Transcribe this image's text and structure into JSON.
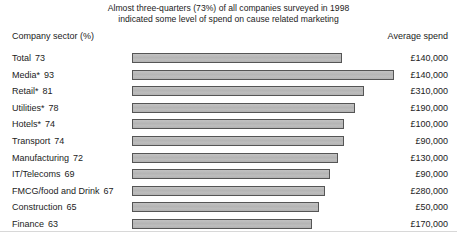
{
  "title": {
    "line1": "Almost three-quarters (73%) of all companies surveyed in 1998",
    "line2": "indicated some level of spend on cause related marketing"
  },
  "headers": {
    "left": "Company sector (%)",
    "right": "Average spend"
  },
  "chart_data": {
    "type": "bar",
    "orientation": "horizontal",
    "title": "Almost three-quarters (73%) of all companies surveyed in 1998 indicated some level of spend on cause related marketing",
    "xlabel": "",
    "ylabel": "Company sector (%)",
    "xlim": [
      0,
      100
    ],
    "grid": false,
    "legend": null,
    "categories": [
      "Total",
      "Media*",
      "Retail*",
      "Utilities*",
      "Hotels*",
      "Transport",
      "Manufacturing",
      "IT/Telecoms",
      "FMCG/food and Drink",
      "Construction",
      "Finance"
    ],
    "values": [
      73,
      93,
      81,
      78,
      74,
      74,
      72,
      69,
      67,
      65,
      63
    ],
    "value_unit": "%",
    "secondary_series": {
      "name": "Average spend",
      "values": [
        "£140,000",
        "£140,000",
        "£310,000",
        "£190,000",
        "£100,000",
        "£90,000",
        "£130,000",
        "£90,000",
        "£280,000",
        "£50,000",
        "£170,000"
      ],
      "numeric_values": [
        140000,
        140000,
        310000,
        190000,
        100000,
        90000,
        130000,
        90000,
        280000,
        50000,
        170000
      ]
    },
    "colors": {
      "bar_fill": "#b9b9b9",
      "bar_border": "#555555",
      "text": "#1b1b1b",
      "background": "#ffffff"
    }
  },
  "rows": [
    {
      "sector": "Total",
      "pct": "73",
      "bar_width_px": 210,
      "spend": "£140,000"
    },
    {
      "sector": "Media*",
      "pct": "93",
      "bar_width_px": 262,
      "spend": "£140,000"
    },
    {
      "sector": "Retail*",
      "pct": "81",
      "bar_width_px": 232,
      "spend": "£310,000"
    },
    {
      "sector": "Utilities*",
      "pct": "78",
      "bar_width_px": 223,
      "spend": "£190,000"
    },
    {
      "sector": "Hotels*",
      "pct": "74",
      "bar_width_px": 212,
      "spend": "£100,000"
    },
    {
      "sector": "Transport",
      "pct": "74",
      "bar_width_px": 212,
      "spend": "£90,000"
    },
    {
      "sector": "Manufacturing",
      "pct": "72",
      "bar_width_px": 206,
      "spend": "£130,000"
    },
    {
      "sector": "IT/Telecoms",
      "pct": "69",
      "bar_width_px": 198,
      "spend": "£90,000"
    },
    {
      "sector": "FMCG/food and Drink",
      "pct": "67",
      "bar_width_px": 193,
      "spend": "£280,000"
    },
    {
      "sector": "Construction",
      "pct": "65",
      "bar_width_px": 187,
      "spend": "£50,000"
    },
    {
      "sector": "Finance",
      "pct": "63",
      "bar_width_px": 180,
      "spend": "£170,000"
    }
  ]
}
